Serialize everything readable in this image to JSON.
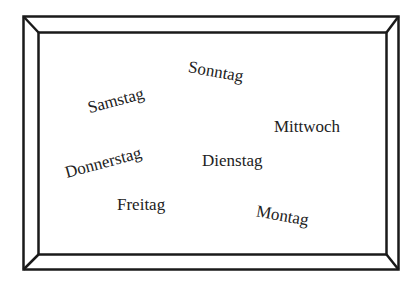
{
  "frame": {
    "stroke_color": "#1a1a1a",
    "background": "#ffffff"
  },
  "words": [
    {
      "label": "Sonntag",
      "left": 188,
      "top": 63,
      "rotate": 10
    },
    {
      "label": "Samstag",
      "left": 87,
      "top": 92,
      "rotate": -15
    },
    {
      "label": "Mittwoch",
      "left": 274,
      "top": 118,
      "rotate": 0
    },
    {
      "label": "Donnerstag",
      "left": 64,
      "top": 154,
      "rotate": -15
    },
    {
      "label": "Dienstag",
      "left": 202,
      "top": 152,
      "rotate": 0
    },
    {
      "label": "Freitag",
      "left": 117,
      "top": 196,
      "rotate": 0
    },
    {
      "label": "Montag",
      "left": 256,
      "top": 207,
      "rotate": 10
    }
  ]
}
